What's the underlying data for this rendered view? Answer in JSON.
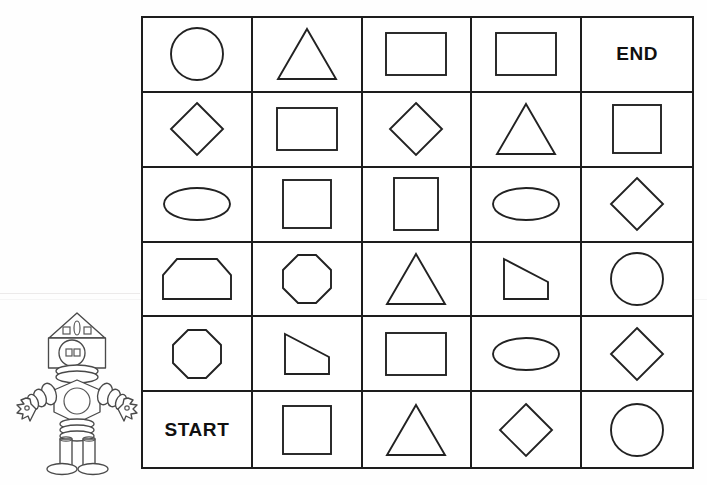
{
  "page": {
    "background_color": "#fefefe",
    "ink_color": "#222222"
  },
  "grid": {
    "rows": 6,
    "columns": 5,
    "border_color": "#1d1d1d",
    "start_label": "START",
    "end_label": "END",
    "cells": [
      [
        {
          "type": "circle",
          "label": ""
        },
        {
          "type": "triangle",
          "label": ""
        },
        {
          "type": "rectangle",
          "label": ""
        },
        {
          "type": "rectangle",
          "label": ""
        },
        {
          "type": "text",
          "label": "END"
        }
      ],
      [
        {
          "type": "diamond",
          "label": ""
        },
        {
          "type": "rectangle",
          "label": ""
        },
        {
          "type": "diamond",
          "label": ""
        },
        {
          "type": "triangle",
          "label": ""
        },
        {
          "type": "square",
          "label": ""
        }
      ],
      [
        {
          "type": "ellipse",
          "label": ""
        },
        {
          "type": "square",
          "label": ""
        },
        {
          "type": "rectangle-portrait",
          "label": ""
        },
        {
          "type": "ellipse",
          "label": ""
        },
        {
          "type": "diamond",
          "label": ""
        }
      ],
      [
        {
          "type": "hexagon",
          "label": ""
        },
        {
          "type": "octagon",
          "label": ""
        },
        {
          "type": "triangle",
          "label": ""
        },
        {
          "type": "trapezoid",
          "label": ""
        },
        {
          "type": "circle",
          "label": ""
        }
      ],
      [
        {
          "type": "octagon",
          "label": ""
        },
        {
          "type": "trapezoid",
          "label": ""
        },
        {
          "type": "rectangle",
          "label": ""
        },
        {
          "type": "ellipse",
          "label": ""
        },
        {
          "type": "diamond",
          "label": ""
        }
      ],
      [
        {
          "type": "text",
          "label": "START"
        },
        {
          "type": "square",
          "label": ""
        },
        {
          "type": "triangle",
          "label": ""
        },
        {
          "type": "diamond",
          "label": ""
        },
        {
          "type": "circle",
          "label": ""
        }
      ]
    ]
  },
  "robot": {
    "name": "robot-mascot",
    "outline_color": "#4a4a4a",
    "parts": [
      "roof-head",
      "face-circle",
      "eyes",
      "neck-rings",
      "body-hexagon",
      "chest-circle",
      "left-arm-segments",
      "right-arm-segments",
      "left-hand-star",
      "right-hand-star",
      "waist-rings",
      "left-leg",
      "right-leg",
      "left-foot",
      "right-foot"
    ]
  }
}
